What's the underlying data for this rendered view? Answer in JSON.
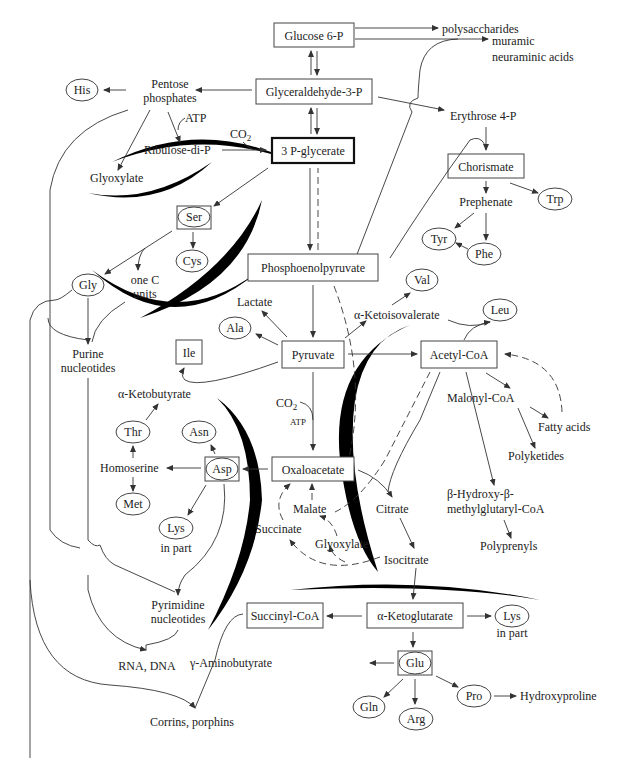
{
  "nodes": {
    "glucose6p": "Glucose 6-P",
    "polysaccharides": "polysaccharides",
    "muramic": "muramic",
    "neuraminic": "neuraminic acids",
    "g3p": "Glyceraldehyde-3-P",
    "his": "His",
    "pentose1": "Pentose",
    "pentose2": "phosphates",
    "atp1": "ATP",
    "co2_1": "CO",
    "sub2": "2",
    "ribulose": "Ribulose-di-P",
    "pglycerate": "3 P-glycerate",
    "erythrose": "Erythrose 4-P",
    "glyoxylate1": "Glyoxylate",
    "chorismate": "Chorismate",
    "trp": "Trp",
    "prephenate": "Prephenate",
    "tyr": "Tyr",
    "phe": "Phe",
    "ser": "Ser",
    "cys": "Cys",
    "gly": "Gly",
    "onec1": "one C",
    "onec2": "units",
    "pep": "Phosphoenolpyruvate",
    "val": "Val",
    "lactate": "Lactate",
    "ala": "Ala",
    "ketoisovalerate": "α-Ketoisovalerate",
    "leu": "Leu",
    "purine1": "Purine",
    "purine2": "nucleotides",
    "ile": "Ile",
    "pyruvate": "Pyruvate",
    "acetylcoa": "Acetyl-CoA",
    "ketobutyrate": "α-Ketobutyrate",
    "co2_2": "CO",
    "atp2": "ATP",
    "malonylcoa": "Malonyl-CoA",
    "fattyacids": "Fatty acids",
    "thr": "Thr",
    "asn": "Asn",
    "polyketides": "Polyketides",
    "homoserine": "Homoserine",
    "asp": "Asp",
    "oxaloacetate": "Oxaloacetate",
    "met": "Met",
    "malate": "Malate",
    "citrate": "Citrate",
    "hmg1": "β-Hydroxy-β-",
    "hmg2": "methylglutaryl-CoA",
    "lys1": "Lys",
    "lys1b": "in part",
    "succinate": "Succinate",
    "glyoxylate2": "Glyoxylate",
    "isocitrate": "Isocitrate",
    "polyprenyls": "Polyprenyls",
    "pyrimidine1": "Pyrimidine",
    "pyrimidine2": "nucleotides",
    "succinylcoa": "Succinyl-CoA",
    "ketoglutarate": "α-Ketoglutarate",
    "lys2": "Lys",
    "lys2b": "in part",
    "rnadna": "RNA, DNA",
    "gaba": "γ-Aminobutyrate",
    "glu": "Glu",
    "pro": "Pro",
    "hydroxyproline": "Hydroxyproline",
    "gln": "Gln",
    "arg": "Arg",
    "corrins": "Corrins, porphins"
  }
}
